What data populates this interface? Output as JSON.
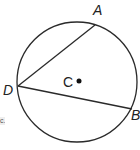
{
  "diagram": {
    "type": "circle-geometry",
    "circle": {
      "center_label": "C",
      "cx": 77,
      "cy": 82,
      "r": 60
    },
    "points": [
      {
        "label": "A",
        "x": 95,
        "y": 25,
        "label_x": 93,
        "label_y": 15
      },
      {
        "label": "D",
        "x": 18,
        "y": 86,
        "label_x": 3,
        "label_y": 95
      },
      {
        "label": "B",
        "x": 132,
        "y": 109,
        "label_x": 131,
        "label_y": 120
      }
    ],
    "center_dot": {
      "x": 79,
      "y": 81
    },
    "center_label_pos": {
      "x": 63,
      "y": 87
    },
    "chords": [
      {
        "from": "D",
        "to": "A"
      },
      {
        "from": "D",
        "to": "B"
      }
    ],
    "stroke_color": "#2a2a2a",
    "edge_fragment": "c."
  }
}
